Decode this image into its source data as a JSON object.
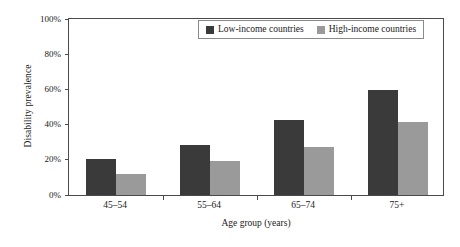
{
  "chart_data": {
    "type": "bar",
    "title": "",
    "subtitle": "",
    "xlabel": "Age group (years)",
    "ylabel": "Disability prevalence",
    "categories": [
      "45–54",
      "55–64",
      "65–74",
      "75+"
    ],
    "series": [
      {
        "name": "Low-income countries",
        "values": [
          20,
          28,
          42,
          59
        ],
        "color": "#3a3a3a"
      },
      {
        "name": "High-income countries",
        "values": [
          12,
          19,
          27,
          41
        ],
        "color": "#9a9a9a"
      }
    ],
    "ylim": [
      0,
      100
    ],
    "yticks": [
      0,
      20,
      40,
      60,
      80,
      100
    ],
    "ytick_labels": [
      "0%",
      "20%",
      "40%",
      "60%",
      "80%",
      "100%"
    ],
    "value_suffix": "%",
    "grid": false,
    "legend_position": "top-right-inside",
    "frame": true,
    "bar_group_separators": true
  },
  "legend": {
    "entries": [
      {
        "label": "Low-income countries",
        "swatch": "legend-swatch-low-income"
      },
      {
        "label": "High-income countries",
        "swatch": "legend-swatch-high-income"
      }
    ]
  },
  "colors": {
    "low_income": "#3a3a3a",
    "high_income": "#9a9a9a",
    "axis": "#4a4a4a",
    "legend_border": "#8a8a8a",
    "background": "#ffffff"
  }
}
